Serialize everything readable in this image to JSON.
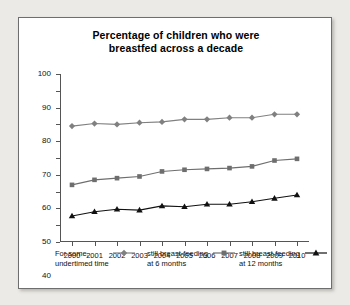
{
  "chart_data": {
    "type": "line",
    "title": "Percentage of children who were breastfed across a decade",
    "title_line1": "Percentage of children who were",
    "title_line2": "breastfed across a decade",
    "xlabel": "",
    "ylabel": "",
    "categories": [
      "2000",
      "2001",
      "2002",
      "2003",
      "2004",
      "2005",
      "2006",
      "2007",
      "2008",
      "2009",
      "2010"
    ],
    "ylim": [
      0,
      100
    ],
    "ytick_labels": [
      "0",
      "10",
      "20",
      "30",
      "40",
      "50",
      "60",
      "70",
      "80",
      "90",
      "100"
    ],
    "ytick_values": [
      0,
      10,
      20,
      30,
      40,
      50,
      60,
      70,
      80,
      90,
      100
    ],
    "grid": false,
    "legend_position": "bottom",
    "series": [
      {
        "name": "For some, undertimed time",
        "label_line1": "For some,",
        "label_line2": "undertimed time",
        "marker": "diamond",
        "color": "#808080",
        "values": [
          69,
          70.5,
          70,
          71,
          71.5,
          73,
          73,
          74,
          74,
          76,
          76
        ]
      },
      {
        "name": "still breast-feeding at 6 months",
        "label_line1": "still breast-feeding",
        "label_line2": "at 6 months",
        "marker": "square",
        "color": "#6e6e6e",
        "values": [
          34,
          37,
          38,
          39,
          42,
          43,
          43.5,
          44,
          45,
          48.5,
          49.5
        ]
      },
      {
        "name": "still breast-feeding at 12 months",
        "label_line1": "still breast-feeding",
        "label_line2": "at 12 months",
        "marker": "triangle",
        "color": "#111111",
        "values": [
          15.5,
          18,
          19.5,
          19,
          21.5,
          21,
          22.5,
          22.5,
          24,
          26,
          28
        ]
      }
    ]
  }
}
